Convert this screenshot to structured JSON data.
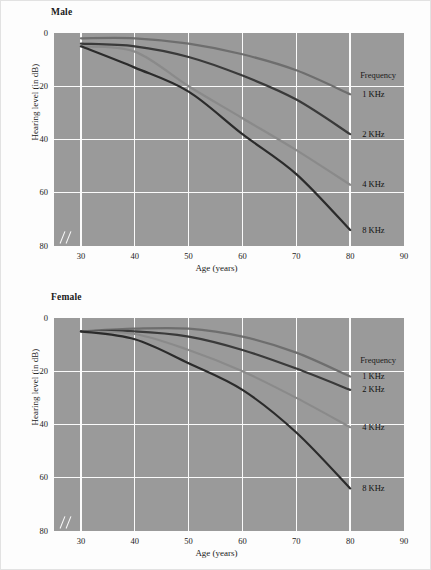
{
  "figure": {
    "background_color": "#fdfdfd",
    "plot_background_color": "#9a9a9a",
    "grid_color": "#fbfbfb"
  },
  "panels": [
    {
      "key": "male",
      "title": "Male",
      "legend_title": "Frequency",
      "legend": [
        {
          "label": "1 KHz",
          "color": "#6e6e6e",
          "y_at_80": 23
        },
        {
          "label": "2 KHz",
          "color": "#3a3a3a",
          "y_at_80": 38
        },
        {
          "label": "4 KHz",
          "color": "#8a8a8a",
          "y_at_80": 57
        },
        {
          "label": "8 KHz",
          "color": "#2b2b2b",
          "y_at_80": 74
        }
      ]
    },
    {
      "key": "female",
      "title": "Female",
      "legend_title": "Frequency",
      "legend": [
        {
          "label": "1 KHz",
          "color": "#6e6e6e",
          "y_at_80": 22
        },
        {
          "label": "2 KHz",
          "color": "#3a3a3a",
          "y_at_80": 27
        },
        {
          "label": "4 KHz",
          "color": "#8a8a8a",
          "y_at_80": 41
        },
        {
          "label": "8 KHz",
          "color": "#2b2b2b",
          "y_at_80": 64
        }
      ]
    }
  ],
  "axes": {
    "xlabel": "Age (years)",
    "ylabel": "Hearing level (in dB)",
    "xticks": [
      30,
      40,
      50,
      60,
      70,
      80,
      90
    ],
    "yticks": [
      0,
      20,
      40,
      60,
      80
    ],
    "xlim": [
      25,
      90
    ],
    "ylim": [
      0,
      80
    ],
    "y_inverted": true,
    "axis_break": "//"
  },
  "chart_data": [
    {
      "type": "line",
      "title": "Male",
      "xlabel": "Age (years)",
      "ylabel": "Hearing level (in dB)",
      "xlim": [
        25,
        90
      ],
      "ylim": [
        0,
        80
      ],
      "y_inverted": true,
      "grid": true,
      "legend_title": "Frequency",
      "legend_position": "right",
      "x": [
        30,
        40,
        50,
        60,
        70,
        80
      ],
      "series": [
        {
          "name": "1 KHz",
          "color": "#6e6e6e",
          "values": [
            2,
            2,
            4,
            8,
            14,
            23
          ]
        },
        {
          "name": "2 KHz",
          "color": "#3a3a3a",
          "values": [
            4,
            5,
            9,
            16,
            25,
            38
          ]
        },
        {
          "name": "4 KHz",
          "color": "#8a8a8a",
          "values": [
            5,
            7,
            20,
            32,
            44,
            57
          ]
        },
        {
          "name": "8 KHz",
          "color": "#2b2b2b",
          "values": [
            5,
            13,
            22,
            38,
            53,
            74
          ]
        }
      ]
    },
    {
      "type": "line",
      "title": "Female",
      "xlabel": "Age (years)",
      "ylabel": "Hearing level (in dB)",
      "xlim": [
        25,
        90
      ],
      "ylim": [
        0,
        80
      ],
      "y_inverted": true,
      "grid": true,
      "legend_title": "Frequency",
      "legend_position": "right",
      "x": [
        30,
        40,
        50,
        60,
        70,
        80
      ],
      "series": [
        {
          "name": "1 KHz",
          "color": "#6e6e6e",
          "values": [
            5,
            4,
            4,
            7,
            13,
            22
          ]
        },
        {
          "name": "2 KHz",
          "color": "#3a3a3a",
          "values": [
            5,
            5,
            7,
            12,
            19,
            27
          ]
        },
        {
          "name": "4 KHz",
          "color": "#8a8a8a",
          "values": [
            5,
            6,
            12,
            20,
            30,
            41
          ]
        },
        {
          "name": "8 KHz",
          "color": "#2b2b2b",
          "values": [
            5,
            8,
            17,
            27,
            43,
            64
          ]
        }
      ]
    }
  ]
}
